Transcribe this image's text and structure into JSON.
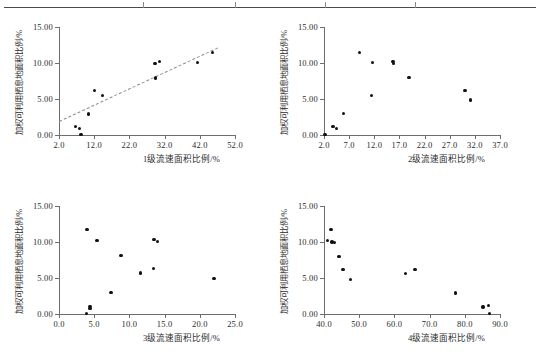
{
  "figure": {
    "top_rule": true,
    "top_rule_ticks": [
      430,
      706,
      976,
      1244
    ],
    "y_axis_label": "加权可利用栖息地面积比例/%",
    "y_ticks": [
      "15.00",
      "10.00",
      "5.00",
      "0.00"
    ],
    "y_tick_values": [
      15,
      10,
      5,
      0
    ],
    "ylim": [
      0,
      15
    ]
  },
  "chart_data": [
    {
      "id": "panel-1",
      "type": "scatter",
      "title": "",
      "xlabel": "1级流速面积比例/%",
      "ylabel": "加权可利用栖息地面积比例/%",
      "xlim": [
        2.0,
        52.0
      ],
      "ylim": [
        0.0,
        15.0
      ],
      "xticks": [
        "2.0",
        "12.0",
        "22.0",
        "32.0",
        "42.0",
        "52.0"
      ],
      "xtick_values": [
        2,
        12,
        22,
        32,
        42,
        52
      ],
      "yticks": [
        "0.00",
        "5.00",
        "10.00",
        "15.00"
      ],
      "ytick_values": [
        0,
        5,
        10,
        15
      ],
      "grid": false,
      "legend": "none",
      "points": [
        {
          "x": 6.6,
          "y": 1.2
        },
        {
          "x": 7.9,
          "y": 0.9
        },
        {
          "x": 8.3,
          "y": 0.05
        },
        {
          "x": 10.4,
          "y": 2.9
        },
        {
          "x": 12.1,
          "y": 6.2
        },
        {
          "x": 14.4,
          "y": 5.5
        },
        {
          "x": 29.3,
          "y": 9.95
        },
        {
          "x": 30.6,
          "y": 10.2
        },
        {
          "x": 29.4,
          "y": 7.9
        },
        {
          "x": 41.3,
          "y": 10.1
        },
        {
          "x": 45.6,
          "y": 11.5
        }
      ],
      "trendline": {
        "x0": 2.0,
        "y0": 2.0,
        "x1": 47.0,
        "y1": 12.2,
        "style": "dashed"
      }
    },
    {
      "id": "panel-2",
      "type": "scatter",
      "title": "",
      "xlabel": "2级流速面积比例/%",
      "ylabel": "加权可利用栖息地面积比例/%",
      "xlim": [
        2.0,
        37.0
      ],
      "ylim": [
        0.0,
        15.0
      ],
      "xticks": [
        "2.0",
        "7.0",
        "12.0",
        "17.0",
        "22.0",
        "27.0",
        "32.0",
        "37.0"
      ],
      "xtick_values": [
        2,
        7,
        12,
        17,
        22,
        27,
        32,
        37
      ],
      "yticks": [
        "0.00",
        "5.00",
        "10.00",
        "15.00"
      ],
      "ytick_values": [
        0,
        5,
        10,
        15
      ],
      "grid": false,
      "legend": "none",
      "points": [
        {
          "x": 2.2,
          "y": 0.05
        },
        {
          "x": 3.8,
          "y": 1.15
        },
        {
          "x": 4.5,
          "y": 0.9
        },
        {
          "x": 5.9,
          "y": 3.0
        },
        {
          "x": 9.0,
          "y": 11.5
        },
        {
          "x": 11.6,
          "y": 10.05
        },
        {
          "x": 11.4,
          "y": 5.5
        },
        {
          "x": 15.7,
          "y": 10.2
        },
        {
          "x": 15.8,
          "y": 9.95
        },
        {
          "x": 18.9,
          "y": 7.95
        },
        {
          "x": 30.0,
          "y": 6.2
        },
        {
          "x": 31.1,
          "y": 4.85
        }
      ]
    },
    {
      "id": "panel-3",
      "type": "scatter",
      "title": "",
      "xlabel": "3级流速面积比例/%",
      "ylabel": "加权可利用栖息地面积比例/%",
      "xlim": [
        0.0,
        25.0
      ],
      "ylim": [
        0.0,
        15.0
      ],
      "xticks": [
        "0.0",
        "5.0",
        "10.0",
        "15.0",
        "20.0",
        "25.0"
      ],
      "xtick_values": [
        0,
        5,
        10,
        15,
        20,
        25
      ],
      "yticks": [
        "0.00",
        "5.00",
        "10.00",
        "15.00"
      ],
      "ytick_values": [
        0,
        5,
        10,
        15
      ],
      "grid": false,
      "legend": "none",
      "points": [
        {
          "x": 3.9,
          "y": 0.05
        },
        {
          "x": 4.4,
          "y": 0.75
        },
        {
          "x": 4.4,
          "y": 1.05
        },
        {
          "x": 4.0,
          "y": 11.7
        },
        {
          "x": 5.4,
          "y": 10.25
        },
        {
          "x": 7.4,
          "y": 2.95
        },
        {
          "x": 8.8,
          "y": 8.1
        },
        {
          "x": 11.6,
          "y": 5.7
        },
        {
          "x": 13.4,
          "y": 6.3
        },
        {
          "x": 13.5,
          "y": 10.35
        },
        {
          "x": 14.0,
          "y": 10.05
        },
        {
          "x": 22.0,
          "y": 4.95
        }
      ]
    },
    {
      "id": "panel-4",
      "type": "scatter",
      "title": "",
      "xlabel": "4级流速面积比例/%",
      "ylabel": "加权可利用栖息地面积比例/%",
      "xlim": [
        40.0,
        90.0
      ],
      "ylim": [
        0.0,
        15.0
      ],
      "xticks": [
        "40.0",
        "50.0",
        "60.0",
        "70.0",
        "80.0",
        "90.0"
      ],
      "xtick_values": [
        40,
        50,
        60,
        70,
        80,
        90
      ],
      "yticks": [
        "0.00",
        "5.00",
        "10.00",
        "15.00"
      ],
      "ytick_values": [
        0,
        5,
        10,
        15
      ],
      "grid": false,
      "legend": "none",
      "points": [
        {
          "x": 41.0,
          "y": 10.25
        },
        {
          "x": 42.0,
          "y": 11.7
        },
        {
          "x": 42.3,
          "y": 10.0
        },
        {
          "x": 42.9,
          "y": 9.95
        },
        {
          "x": 44.3,
          "y": 8.0
        },
        {
          "x": 45.4,
          "y": 6.2
        },
        {
          "x": 47.6,
          "y": 4.8
        },
        {
          "x": 63.2,
          "y": 5.6
        },
        {
          "x": 65.8,
          "y": 6.15
        },
        {
          "x": 77.3,
          "y": 2.9
        },
        {
          "x": 85.2,
          "y": 0.95
        },
        {
          "x": 86.8,
          "y": 1.2
        },
        {
          "x": 87.1,
          "y": 0.05
        }
      ]
    }
  ]
}
